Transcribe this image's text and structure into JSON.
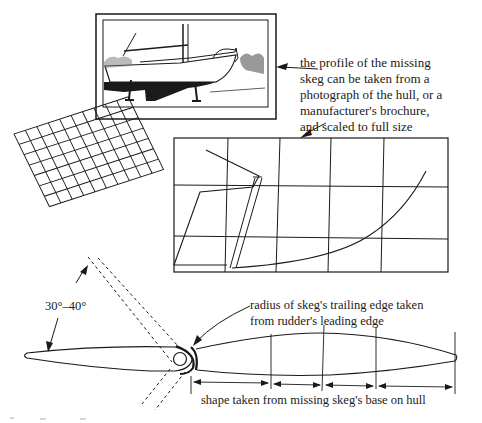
{
  "figure": {
    "photo": {
      "description": "photograph of sailboat hull on stands"
    },
    "annotations": {
      "profile_note": [
        "the profile of the missing",
        "skeg can be taken from a",
        "photograph of the hull, or a",
        "manufacturer's brochure,",
        "and scaled to full size"
      ],
      "angle": "30°–40°",
      "radius_note": [
        "radius of skeg's trailing edge taken",
        "from rudder's leading edge"
      ],
      "shape_note": "shape taken from missing skeg's base on hull"
    },
    "colors": {
      "ink": "#1a1a1a",
      "paper": "#ffffff"
    }
  }
}
